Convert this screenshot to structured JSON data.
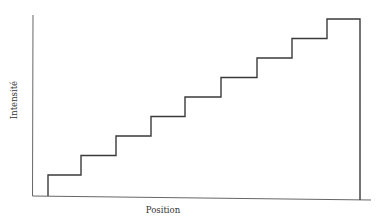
{
  "chart_data": {
    "type": "line",
    "subtype": "step",
    "title": "",
    "xlabel": "Position",
    "ylabel": "Intensité",
    "grid": false,
    "legend": null,
    "ticks": false,
    "steps": [
      {
        "x_start": 48,
        "x_end": 81,
        "level": 1
      },
      {
        "x_start": 81,
        "x_end": 116,
        "level": 2
      },
      {
        "x_start": 116,
        "x_end": 151,
        "level": 3
      },
      {
        "x_start": 151,
        "x_end": 185,
        "level": 4
      },
      {
        "x_start": 185,
        "x_end": 221,
        "level": 5
      },
      {
        "x_start": 221,
        "x_end": 257,
        "level": 6
      },
      {
        "x_start": 257,
        "x_end": 292,
        "level": 7
      },
      {
        "x_start": 292,
        "x_end": 327,
        "level": 8
      },
      {
        "x_start": 327,
        "x_end": 360,
        "level": 9
      }
    ],
    "values": [
      1,
      2,
      3,
      4,
      5,
      6,
      7,
      8,
      9
    ],
    "note": "Staircase intensity profile: nine equal steps rising left to right, then dropping to zero at the right edge."
  },
  "labels": {
    "x_axis": "Position",
    "y_axis": "Intensité"
  },
  "colors": {
    "line": "#3a3a3a",
    "axis": "#555555",
    "background": "#ffffff"
  }
}
